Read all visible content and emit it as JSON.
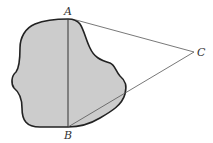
{
  "diagram": {
    "points": [
      {
        "label": "A",
        "x": 68,
        "y": 19
      },
      {
        "label": "B",
        "x": 68,
        "y": 127
      },
      {
        "label": "C",
        "x": 194,
        "y": 52
      }
    ],
    "segments": [
      "AB",
      "AC",
      "CB"
    ],
    "region": {
      "fill": "#cccccc",
      "stroke": "#222222",
      "description": "irregular shaded region containing segment AB"
    },
    "line_color": "#333333"
  },
  "labels": {
    "a": "A",
    "b": "B",
    "c": "C"
  }
}
